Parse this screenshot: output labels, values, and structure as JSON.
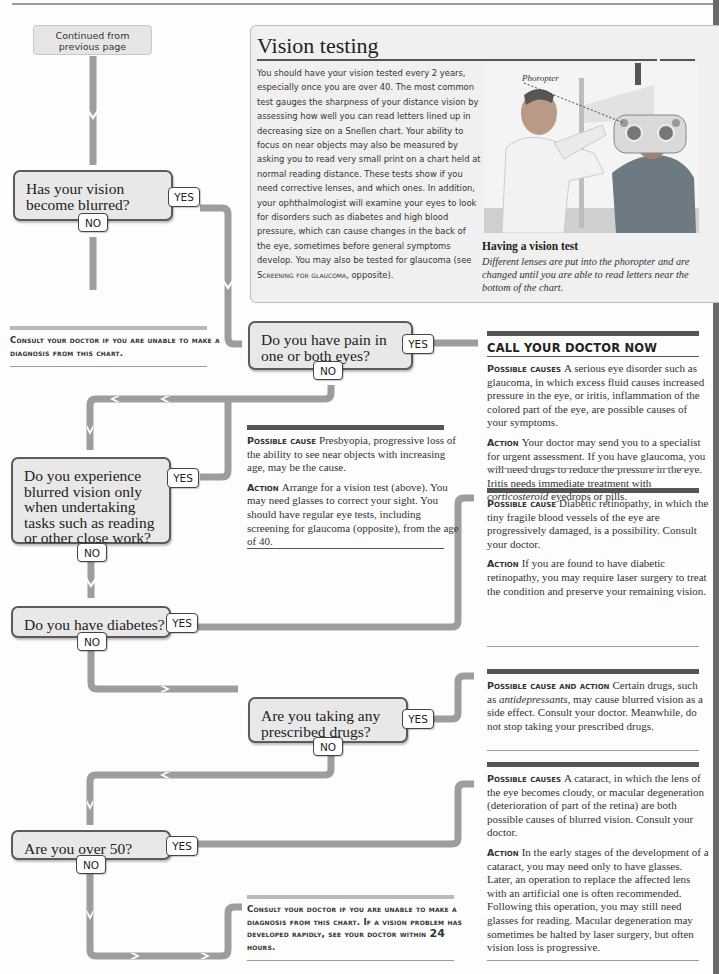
{
  "page": {
    "start_box": "Continued from previous page"
  },
  "vision_testing": {
    "title": "Vision testing",
    "body": "You should have your vision tested every 2 years, especially once you are over 40. The most common test gauges the sharpness of your distance vision by assessing how well you can read letters lined up in decreasing size on a Snellen chart. Your ability to focus on near objects may also be measured by asking you to read very small print on a chart held at normal reading distance. These tests show if you need corrective lenses, and which ones. In addition, your ophthalmologist will examine your eyes to look for disorders such as diabetes and high blood pressure, which can cause changes in the back of the eye, sometimes before general symptoms develop. You may also be tested for glaucoma (see ",
    "body_ref": "Screening for glaucoma",
    "body_end": ", opposite).",
    "photo_label": "Phoropter",
    "caption_title": "Having a vision test",
    "caption_body": "Different lenses are put into the phoropter and are changed until you are able to read letters near the bottom of the chart."
  },
  "questions": [
    {
      "text": "Has your vision become blurred?",
      "yes": "YES",
      "no": "NO"
    },
    {
      "text": "Do you have pain in one or both eyes?",
      "yes": "YES",
      "no": "NO"
    },
    {
      "text": "Do you experience blurred vision only when undertaking tasks such as reading or other close work?",
      "yes": "YES",
      "no": "NO"
    },
    {
      "text": "Do you have diabetes?",
      "yes": "YES",
      "no": "NO"
    },
    {
      "text": "Are you taking any prescribed drugs?",
      "yes": "YES",
      "no": "NO"
    },
    {
      "text": "Are you over 50?",
      "yes": "YES",
      "no": "NO"
    }
  ],
  "consult_top": "Consult your doctor if you are unable to make a diagnosis from this chart.",
  "consult_bottom": {
    "text1": "Consult your doctor if you are unable to make a diagnosis from this chart. If a vision problem has developed rapidly, see your doctor within ",
    "hours": "24",
    "text2": " hours."
  },
  "answers": {
    "pain": {
      "heading": "CALL YOUR DOCTOR NOW",
      "cause_label": "Possible causes",
      "cause": "A serious eye disorder such as glaucoma, in which excess fluid causes increased pressure in the eye, or iritis, inflammation of the colored part of the eye, are possible causes of your symptoms.",
      "action_label": "Action",
      "action_pre": "Your doctor may send you to a specialist for urgent assessment. If you have glaucoma, you will need drugs to reduce the pressure in the eye. Iritis needs immediate treatment with ",
      "action_em": "corticosteroid",
      "action_post": " eyedrops or pills."
    },
    "close_work": {
      "cause_label": "Possible cause",
      "cause": "Presbyopia, progressive loss of the ability to see near objects with increasing age, may be the cause.",
      "action_label": "Action",
      "action": "Arrange for a vision test (above). You may need glasses to correct your sight. You should have regular eye tests, including screening for glaucoma (opposite), from the age of 40."
    },
    "diabetes": {
      "cause_label": "Possible cause",
      "cause": "Diabetic retinopathy, in which the tiny fragile blood vessels of the eye are progressively damaged, is a possibility. Consult your doctor.",
      "action_label": "Action",
      "action": "If you are found to have diabetic retinopathy, you may require laser surgery to treat the condition and preserve your remaining vision."
    },
    "drugs": {
      "label": "Possible cause and action",
      "pre": "Certain drugs, such as ",
      "em": "antidepressants",
      "post": ", may cause blurred vision as a side effect. Consult your doctor. Meanwhile, do not stop taking your prescribed drugs."
    },
    "over50": {
      "cause_label": "Possible causes",
      "cause": "A cataract, in which the lens of the eye becomes cloudy, or macular degeneration (deterioration of part of the retina) are both possible causes of blurred vision. Consult your doctor.",
      "action_label": "Action",
      "action": "In the early stages of the development of a cataract, you may need only to have glasses. Later, an operation to replace the affected lens with an artificial one is often recommended. Following this operation, you may still need glasses for reading. Macular degeneration may sometimes be halted by laser surgery, but often vision loss is progressive."
    }
  },
  "colors": {
    "connector": "#9d9d9d",
    "question_fill": "#e8e8e8",
    "question_border": "#5b5b5b",
    "panel_fill": "#f0f0f0",
    "dark_rule": "#555555"
  }
}
